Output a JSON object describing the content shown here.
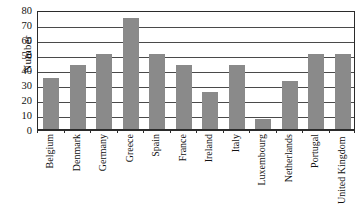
{
  "chart_data": {
    "type": "bar",
    "title": "",
    "xlabel": "",
    "ylabel": "Number",
    "ylim": [
      0,
      80
    ],
    "ytick_step": 10,
    "yticks": [
      0,
      10,
      20,
      30,
      40,
      50,
      60,
      70,
      80
    ],
    "grid": true,
    "grid_axis": "y",
    "legend": "none",
    "bar_color": "#8a8a8a",
    "axis_color": "#2b2b2b",
    "categories": [
      "Belgium",
      "Denmark",
      "Germany",
      "Greece",
      "Spain",
      "France",
      "Ireland",
      "Italy",
      "Luxembourg",
      "Netherlands",
      "Portugal",
      "United Kingdom"
    ],
    "values": [
      34,
      43,
      50,
      74,
      50,
      43,
      25,
      43,
      7,
      32,
      50,
      50
    ]
  }
}
